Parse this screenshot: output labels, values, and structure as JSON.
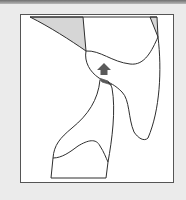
{
  "figure": {
    "type": "line-art-diagram",
    "background_color": "#ebebeb",
    "frame_color": "#555555",
    "frame_fill": "#ffffff",
    "stroke_color": "#2e2e2e",
    "shade_light": "#d6d6d6",
    "shade_dark": "#5a5a5a",
    "marker": {
      "icon": "up-arrow-icon",
      "color": "#5a5a5a",
      "description": "Dark gray upward arrow pointing at junction"
    },
    "shaded_regions": [
      {
        "name": "top-left-triangle",
        "fill": "light-gray"
      },
      {
        "name": "top-right-sliver",
        "fill": "light-gray"
      },
      {
        "name": "junction-wedge",
        "fill": "dark-gray"
      }
    ],
    "labels": []
  }
}
